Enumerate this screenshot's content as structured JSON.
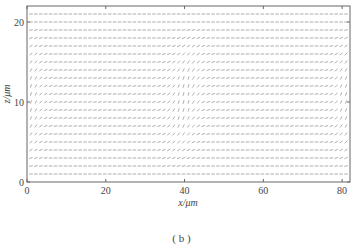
{
  "chart_data": {
    "type": "quiver",
    "title": "",
    "xlabel": "x/μm",
    "ylabel": "z/μm",
    "xlim": [
      0,
      82
    ],
    "ylim": [
      0,
      22
    ],
    "xticks": [
      0,
      20,
      40,
      60,
      80
    ],
    "xtick_labels": [
      "0",
      "20",
      "40",
      "60",
      "80"
    ],
    "yticks": [
      0,
      10,
      20
    ],
    "ytick_labels": [
      "0",
      "10",
      "20"
    ],
    "grid": false,
    "legend": null,
    "caption": "( b )",
    "field": {
      "x_spacing": 1.25,
      "z_rows": [
        1,
        2,
        3,
        4,
        5,
        6,
        7,
        8,
        9,
        10,
        11,
        12,
        13,
        14,
        15,
        16,
        17,
        18,
        19,
        20,
        21
      ],
      "description": "Magnetization vector field; arrows nearly horizontal at top (z≈21) and bottom (z≈1); strong tilt forming a domain wall centred near x≈40 (leaning right as z increases, 36–46 μm), and edge tilting near x≈0–4 and x≈78–82.",
      "wall_centers": [
        {
          "x": 40,
          "width": 5
        },
        {
          "x": 1,
          "width": 4
        },
        {
          "x": 81,
          "width": 4
        }
      ],
      "arrow_color": "#8a8a8a"
    }
  },
  "axes_color": "#555555"
}
